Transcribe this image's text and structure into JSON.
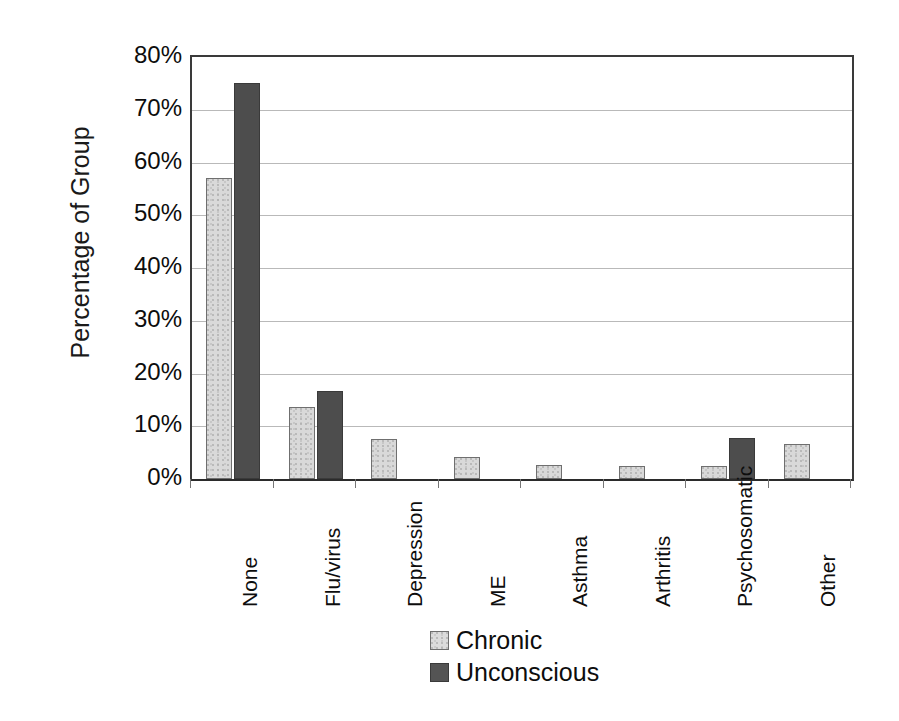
{
  "chart_data": {
    "type": "bar",
    "title": "",
    "xlabel": "",
    "ylabel": "Percentage of Group",
    "ylim": [
      0,
      80
    ],
    "ytick_labels": [
      "80%",
      "70%",
      "60%",
      "50%",
      "40%",
      "30%",
      "20%",
      "10%",
      "0%"
    ],
    "ytick_values": [
      80,
      70,
      60,
      50,
      40,
      30,
      20,
      10,
      0
    ],
    "grid": true,
    "legend_position": "bottom-center",
    "categories": [
      "None",
      "Flu/virus",
      "Depression",
      "ME",
      "Asthma",
      "Arthritis",
      "Psychosomatic",
      "Other"
    ],
    "series": [
      {
        "name": "Chronic",
        "color": "#d9d9d9",
        "values": [
          57,
          13.6,
          7.5,
          4.2,
          2.7,
          2.5,
          2.4,
          6.7
        ]
      },
      {
        "name": "Unconscious",
        "color": "#4d4d4d",
        "values": [
          75,
          16.6,
          0,
          0,
          0,
          0,
          7.7,
          0
        ]
      }
    ]
  },
  "axis": {
    "y_title": "Percentage of Group"
  },
  "legend": {
    "items": [
      {
        "label": "Chronic",
        "swatch": "light-gray-swatch"
      },
      {
        "label": "Unconscious",
        "swatch": "dark-gray-swatch"
      }
    ]
  }
}
